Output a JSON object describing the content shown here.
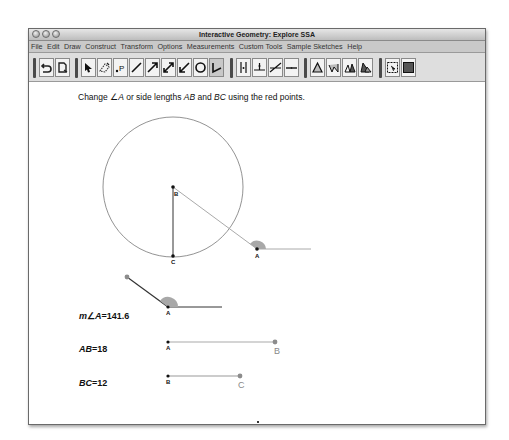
{
  "window": {
    "title": "Interactive Geometry: Explore SSA",
    "traffic_lights": [
      "close",
      "minimize",
      "zoom"
    ]
  },
  "menu": [
    "File",
    "Edit",
    "Draw",
    "Construct",
    "Transform",
    "Options",
    "Measurements",
    "Custom Tools",
    "Sample Sketches",
    "Help"
  ],
  "toolbar": {
    "groups": [
      [
        "undo-icon",
        "new-sketch-icon"
      ],
      [
        "select-arrow-icon",
        "erase-icon",
        "point-tool-icon",
        "segment-icon",
        "ray-icon",
        "line-icon",
        "vector-icon",
        "circle-icon",
        "angle-icon"
      ],
      [
        "parallel-icon",
        "perpendicular-icon",
        "intersect-icon",
        "midline-icon"
      ],
      [
        "triangle-icon",
        "reflect-icon",
        "rotate-icon",
        "dilate-icon"
      ],
      [
        "screenshot-icon",
        "fill-icon"
      ]
    ]
  },
  "instructions": {
    "prefix": "Change ",
    "angle_symbol": "∠",
    "angle_name": "A",
    "middle": " or side lengths ",
    "side1": "AB",
    "and": " and ",
    "side2": "BC",
    "suffix": " using the red points."
  },
  "diagram": {
    "points": {
      "B": {
        "label": "B"
      },
      "C": {
        "label": "C"
      },
      "A": {
        "label": "A"
      }
    }
  },
  "measurements": {
    "angle": {
      "prefix": "m",
      "symbol": "∠",
      "name": "A",
      "eq": "=",
      "value": "141.6",
      "vertex_label": "A"
    },
    "ab": {
      "name": "AB",
      "eq": "=",
      "value": "18",
      "start_label": "A",
      "end_label": "B"
    },
    "bc": {
      "name": "BC",
      "eq": "=",
      "value": "12",
      "start_label": "B",
      "end_label": "C"
    }
  },
  "colors": {
    "angle_fill": "#a8a8a8",
    "control_point": "#8c8c8c",
    "segment": "#a0a0a0"
  }
}
